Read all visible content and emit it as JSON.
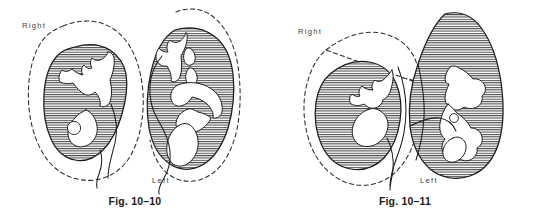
{
  "plate": {
    "background_color": "#ffffff",
    "ink_color": "#1c1c1c",
    "hatch_color": "#4a4a4a"
  },
  "figures": [
    {
      "id": "fig-10-10",
      "caption": "Fig. 10–10",
      "kidneys": [
        {
          "side_label": "Right",
          "has_calculus": true,
          "outline_style": "dashed-silhouette-with-solid-parenchyma"
        },
        {
          "side_label": "Left",
          "has_calculus": false,
          "outline_style": "dashed-silhouette-with-solid-parenchyma"
        }
      ]
    },
    {
      "id": "fig-10-11",
      "caption": "Fig. 10–11",
      "kidneys": [
        {
          "side_label": "Right",
          "has_calculus": false,
          "outline_style": "dashed-silhouette-with-solid-parenchyma"
        },
        {
          "side_label": "Left",
          "has_calculus": true,
          "outline_style": "solid-parenchyma-only"
        }
      ]
    }
  ]
}
